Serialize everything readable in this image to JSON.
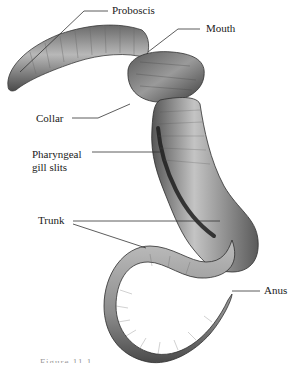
{
  "diagram": {
    "colors": {
      "background": "#ffffff",
      "body_dark": "#3a3a3a",
      "body_mid": "#8a8a8a",
      "body_light": "#d0d0d0",
      "leader_line": "#333333",
      "label_text": "#1a1a1a"
    },
    "labels": {
      "proboscis": "Proboscis",
      "mouth": "Mouth",
      "collar": "Collar",
      "pharyngeal_line1": "Pharyngeal",
      "pharyngeal_line2": "gill slits",
      "trunk": "Trunk",
      "anus": "Anus"
    },
    "caption_fragment": "Figure 11.1"
  }
}
